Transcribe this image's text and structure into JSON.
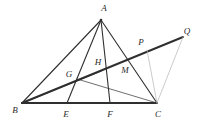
{
  "figure": {
    "kind": "geometry-diagram",
    "width": 207,
    "height": 126,
    "background_color": "#ffffff",
    "stroke_color_dark": "#2f2f2f",
    "stroke_color_light": "#b4b4b4",
    "label_color": "#2b2b2b"
  },
  "points": {
    "A": {
      "label": "A",
      "x": 101,
      "y": 20,
      "label_x": 104,
      "label_y": 8
    },
    "B": {
      "label": "B",
      "x": 22,
      "y": 103,
      "label_x": 15,
      "label_y": 110
    },
    "C": {
      "label": "C",
      "x": 157,
      "y": 103,
      "label_x": 158,
      "label_y": 114
    },
    "E": {
      "label": "E",
      "x": 67,
      "y": 103,
      "label_x": 66,
      "label_y": 114
    },
    "F": {
      "label": "F",
      "x": 110,
      "y": 103,
      "label_x": 110,
      "label_y": 114
    },
    "G": {
      "label": "G",
      "x": 77,
      "y": 79,
      "label_x": 69,
      "label_y": 74
    },
    "H": {
      "label": "H",
      "x": 101,
      "y": 71,
      "label_x": 98,
      "label_y": 62
    },
    "M": {
      "label": "M",
      "x": 128,
      "y": 73,
      "label_x": 125,
      "label_y": 70
    },
    "P": {
      "label": "P",
      "x": 147,
      "y": 50,
      "label_x": 141,
      "label_y": 42
    },
    "Q": {
      "label": "Q",
      "x": 183,
      "y": 37,
      "label_x": 187,
      "label_y": 31
    }
  },
  "segments": [
    {
      "name": "segment-AB",
      "from": "A",
      "to": "B",
      "weight": "medium",
      "shade": "dark"
    },
    {
      "name": "segment-AC",
      "from": "A",
      "to": "C",
      "weight": "medium",
      "shade": "dark"
    },
    {
      "name": "segment-AE",
      "from": "A",
      "to": "E",
      "weight": "medium",
      "shade": "dark"
    },
    {
      "name": "segment-AF",
      "from": "A",
      "to": "F",
      "weight": "medium",
      "shade": "dark"
    },
    {
      "name": "segment-BC",
      "from": "B",
      "to": "C",
      "weight": "heavy",
      "shade": "dark"
    },
    {
      "name": "segment-BQ",
      "from": "B",
      "to": "Q",
      "weight": "heavy",
      "shade": "dark"
    },
    {
      "name": "segment-BH",
      "from": "B",
      "to": "H",
      "weight": "medium",
      "shade": "dark"
    },
    {
      "name": "segment-GC",
      "from": "G",
      "to": "C",
      "weight": "thin",
      "shade": "dark"
    },
    {
      "name": "segment-PC",
      "from": "P",
      "to": "C",
      "weight": "thin",
      "shade": "light"
    },
    {
      "name": "segment-QC",
      "from": "Q",
      "to": "C",
      "weight": "thin",
      "shade": "light"
    }
  ],
  "labels": [
    {
      "name": "vertex-label-A",
      "key": "A"
    },
    {
      "name": "vertex-label-B",
      "key": "B"
    },
    {
      "name": "vertex-label-C",
      "key": "C"
    },
    {
      "name": "vertex-label-E",
      "key": "E"
    },
    {
      "name": "vertex-label-F",
      "key": "F"
    },
    {
      "name": "vertex-label-G",
      "key": "G"
    },
    {
      "name": "vertex-label-H",
      "key": "H"
    },
    {
      "name": "vertex-label-M",
      "key": "M"
    },
    {
      "name": "vertex-label-P",
      "key": "P"
    },
    {
      "name": "vertex-label-Q",
      "key": "Q"
    }
  ]
}
